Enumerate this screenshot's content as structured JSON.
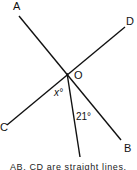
{
  "diagram": {
    "points": {
      "A": {
        "label": "A",
        "x": 19,
        "y": 16
      },
      "B": {
        "label": "B",
        "x": 121,
        "y": 140
      },
      "C": {
        "label": "C",
        "x": 7,
        "y": 125
      },
      "D": {
        "label": "D",
        "x": 125,
        "y": 27
      },
      "O": {
        "label": "O",
        "x": 67,
        "y": 73
      },
      "E": {
        "x": 80,
        "y": 157
      }
    },
    "angles": {
      "x_label": "x°",
      "given_label": "21°"
    },
    "caption": "AB, CD are straight lines."
  }
}
